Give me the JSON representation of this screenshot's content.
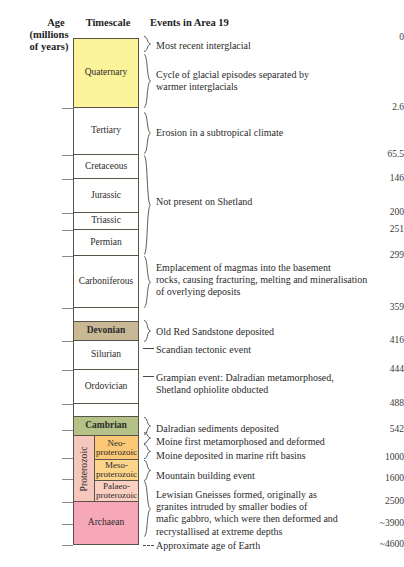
{
  "headers": {
    "age_line1": "Age",
    "age_line2": "(millions",
    "age_line3": "of years)",
    "timescale": "Timescale",
    "events": "Events in Area 19"
  },
  "axis": {
    "ticks": [
      {
        "label": "0",
        "y": 38
      },
      {
        "label": "2.6",
        "y": 108
      },
      {
        "label": "65.5",
        "y": 155
      },
      {
        "label": "146",
        "y": 179
      },
      {
        "label": "200",
        "y": 213
      },
      {
        "label": "251",
        "y": 230
      },
      {
        "label": "299",
        "y": 256
      },
      {
        "label": "359",
        "y": 308
      },
      {
        "label": "416",
        "y": 341
      },
      {
        "label": "444",
        "y": 370
      },
      {
        "label": "488",
        "y": 404
      },
      {
        "label": "542",
        "y": 430
      },
      {
        "label": "1000",
        "y": 458
      },
      {
        "label": "1600",
        "y": 479
      },
      {
        "label": "2500",
        "y": 502
      },
      {
        "label": "~3900",
        "y": 524
      },
      {
        "label": "~4600",
        "y": 545
      }
    ]
  },
  "timescale": {
    "periods": [
      {
        "name": "Quaternary",
        "top": 38,
        "height": 70,
        "color": "#fbf49b",
        "bold": false
      },
      {
        "name": "Tertiary",
        "top": 108,
        "height": 47,
        "color": "#ffffff",
        "bold": false
      },
      {
        "name": "Cretaceous",
        "top": 155,
        "height": 24,
        "color": "#ffffff",
        "bold": false
      },
      {
        "name": "Jurassic",
        "top": 179,
        "height": 34,
        "color": "#ffffff",
        "bold": false
      },
      {
        "name": "Triassic",
        "top": 213,
        "height": 17,
        "color": "#ffffff",
        "bold": false
      },
      {
        "name": "Permian",
        "top": 230,
        "height": 26,
        "color": "#ffffff",
        "bold": false
      },
      {
        "name": "Carboniferous",
        "top": 256,
        "height": 52,
        "color": "#ffffff",
        "bold": false
      },
      {
        "name": "",
        "top": 308,
        "height": 14,
        "color": "#ffffff",
        "bold": false
      },
      {
        "name": "Devonian",
        "top": 322,
        "height": 19,
        "color": "#c9b896",
        "bold": true
      },
      {
        "name": "Silurian",
        "top": 341,
        "height": 29,
        "color": "#ffffff",
        "bold": false
      },
      {
        "name": "Ordovician",
        "top": 370,
        "height": 34,
        "color": "#ffffff",
        "bold": false
      },
      {
        "name": "",
        "top": 404,
        "height": 13,
        "color": "#ffffff",
        "bold": false
      },
      {
        "name": "Cambrian",
        "top": 417,
        "height": 19,
        "color": "#b5c287",
        "bold": true
      },
      {
        "name": "Archaean",
        "top": 502,
        "height": 43,
        "color": "#f7a8b8",
        "bold": false
      }
    ],
    "proterozoic": {
      "label": "Proterozoic",
      "top": 436,
      "height": 66,
      "color": "#f6c7bd",
      "subdivisions": [
        {
          "name": "Neo-\nproterozoic",
          "top": 436,
          "height": 24,
          "color": "#fbc877"
        },
        {
          "name": "Meso-\nproterozoic",
          "top": 460,
          "height": 21,
          "color": "#fcd58a"
        },
        {
          "name": "Palaeo-\nproterozoic",
          "top": 481,
          "height": 21,
          "color": "#fbcfc2"
        }
      ]
    }
  },
  "events": [
    {
      "text": "Most recent interglacial",
      "top": 40,
      "mark": "brace",
      "mark_top": 36,
      "mark_height": 16
    },
    {
      "text": "Cycle of glacial episodes separated by\nwarmer interglacials",
      "top": 69,
      "mark": "brace",
      "mark_top": 54,
      "mark_height": 54
    },
    {
      "text": "Erosion in a subtropical climate",
      "top": 127,
      "mark": "brace",
      "mark_top": 112,
      "mark_height": 42
    },
    {
      "text": "Not present on Shetland",
      "top": 196,
      "mark": "brace",
      "mark_top": 155,
      "mark_height": 100
    },
    {
      "text": "Emplacement of magmas into the basement\nrocks, causing fracturing, melting and mineralisation\nof overlying deposits",
      "top": 262,
      "mark": "brace",
      "mark_top": 256,
      "mark_height": 52
    },
    {
      "text": "Old Red Sandstone deposited",
      "top": 326,
      "mark": "brace",
      "mark_top": 320,
      "mark_height": 22
    },
    {
      "text": "Scandian tectonic event",
      "top": 344,
      "mark": "dash",
      "mark_top": 348,
      "mark_height": 1
    },
    {
      "text": "Grampian event: Dalradian metamorphosed,\nShetland ophiolite obducted",
      "top": 372,
      "mark": "dash",
      "mark_top": 376,
      "mark_height": 1
    },
    {
      "text": "Dalradian sediments deposited",
      "top": 423,
      "mark": "brace",
      "mark_top": 417,
      "mark_height": 18
    },
    {
      "text": "Moine first metamorphosed and deformed",
      "top": 436,
      "mark": "brace",
      "mark_top": 432,
      "mark_height": 12
    },
    {
      "text": "Moine deposited in marine rift basins",
      "top": 450,
      "mark": "brace",
      "mark_top": 444,
      "mark_height": 15
    },
    {
      "text": "Mountain building event",
      "top": 470,
      "mark": "brace",
      "mark_top": 460,
      "mark_height": 21
    },
    {
      "text": "Lewisian Gneisses formed, originally as\ngranites intruded by smaller bodies of\nmafic gabbro, which were then deformed and\nrecrystallised at extreme depths",
      "top": 489,
      "mark": "brace",
      "mark_top": 481,
      "mark_height": 56
    },
    {
      "text": "Approximate age of Earth",
      "top": 540,
      "mark": "dotted",
      "mark_top": 545,
      "mark_height": 1
    }
  ],
  "colors": {
    "border": "#5a5348",
    "quaternary": "#fbf49b",
    "devonian": "#c9b896",
    "cambrian": "#b5c287",
    "proterozoic": "#f6c7bd",
    "archaean": "#f7a8b8",
    "text": "#2b2b2b"
  }
}
